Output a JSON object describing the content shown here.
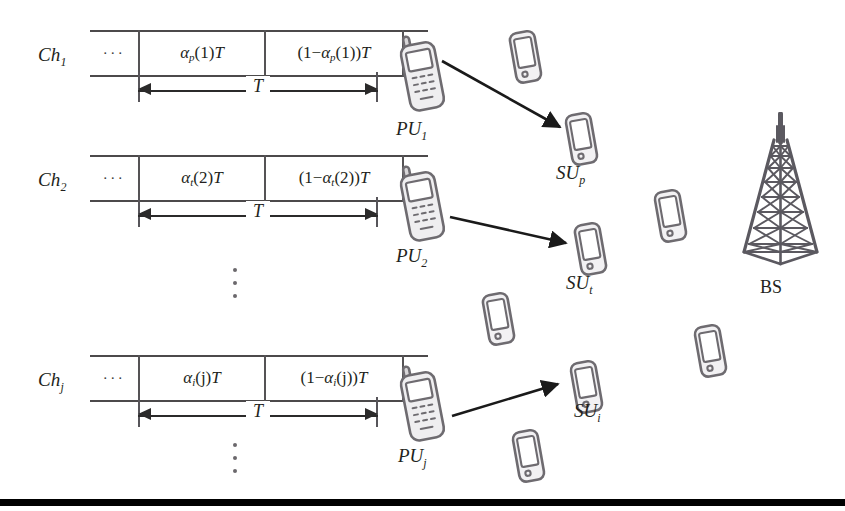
{
  "figure": {
    "type": "network-diagram"
  },
  "channels": [
    {
      "id": "ch1",
      "label_base": "Ch",
      "label_sub": "1",
      "left_dots": "···",
      "right_dots": "···",
      "slot1": {
        "alpha": "α",
        "alpha_sub": "p",
        "index": "(1)",
        "tail": "T"
      },
      "slot2": {
        "prefix": "(1−",
        "alpha": "α",
        "alpha_sub": "p",
        "index": "(1)",
        "suffix": ")",
        "tail": "T"
      },
      "duration_label": "T"
    },
    {
      "id": "ch2",
      "label_base": "Ch",
      "label_sub": "2",
      "left_dots": "···",
      "right_dots": "···",
      "slot1": {
        "alpha": "α",
        "alpha_sub": "t",
        "index": "(2)",
        "tail": "T"
      },
      "slot2": {
        "prefix": "(1−",
        "alpha": "α",
        "alpha_sub": "t",
        "index": "(2)",
        "suffix": ")",
        "tail": "T"
      },
      "duration_label": "T"
    },
    {
      "id": "chj",
      "label_base": "Ch",
      "label_sub": "j",
      "left_dots": "···",
      "right_dots": "···",
      "slot1": {
        "alpha": "α",
        "alpha_sub": "i",
        "index": "(j)",
        "tail": "T"
      },
      "slot2": {
        "prefix": "(1−",
        "alpha": "α",
        "alpha_sub": "i",
        "index": "(j)",
        "suffix": ")",
        "tail": "T"
      },
      "duration_label": "T"
    }
  ],
  "primary_users": [
    {
      "id": "pu1",
      "base": "PU",
      "sub": "1"
    },
    {
      "id": "pu2",
      "base": "PU",
      "sub": "2"
    },
    {
      "id": "puj",
      "base": "PU",
      "sub": "j"
    }
  ],
  "secondary_users": [
    {
      "id": "sup",
      "base": "SU",
      "sub": "p"
    },
    {
      "id": "sut",
      "base": "SU",
      "sub": "t"
    },
    {
      "id": "sui",
      "base": "SU",
      "sub": "i"
    }
  ],
  "base_station": {
    "label": "BS",
    "icon": "tower-icon"
  },
  "links": [
    {
      "from": "PU1",
      "to": "SUp"
    },
    {
      "from": "PU2",
      "to": "SUt"
    },
    {
      "from": "PUj",
      "to": "SUi"
    }
  ],
  "idle_devices_count": 5,
  "colors": {
    "ink": "#231f20",
    "line": "#4c4a4b",
    "device_stroke": "#6e6b70",
    "arrow": "#1a1a1a",
    "rule": "#000000"
  }
}
